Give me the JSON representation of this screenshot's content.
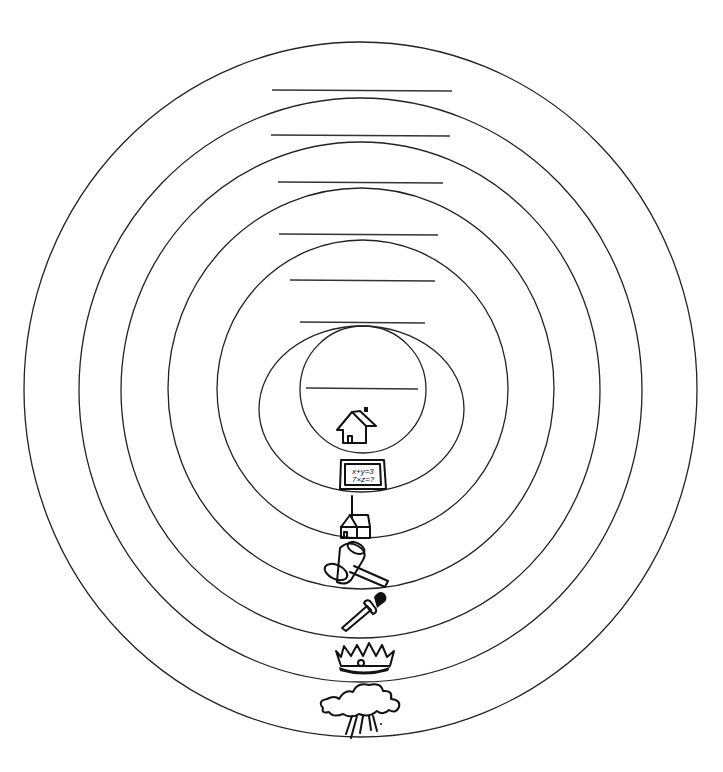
{
  "diagram": {
    "type": "concentric-circles",
    "ring_count": 7,
    "rings": [
      {
        "index": 1,
        "label_line": "",
        "icon": "storm-cloud-icon"
      },
      {
        "index": 2,
        "label_line": "",
        "icon": "crown-icon"
      },
      {
        "index": 3,
        "label_line": "",
        "icon": "sword-icon"
      },
      {
        "index": 4,
        "label_line": "",
        "icon": "gavel-icon"
      },
      {
        "index": 5,
        "label_line": "",
        "icon": "church-icon"
      },
      {
        "index": 6,
        "label_line": "",
        "icon": "chalkboard-icon"
      },
      {
        "index": 7,
        "label_line": "",
        "icon": "house-icon"
      }
    ],
    "chalkboard_text": {
      "line1": "x+y=3",
      "line2": "7×z=?"
    },
    "stroke_color": "#222222",
    "background": "#ffffff"
  }
}
